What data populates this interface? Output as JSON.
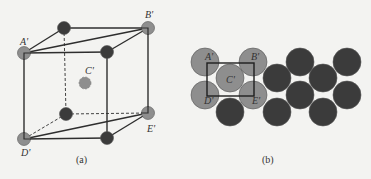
{
  "colors": {
    "background": "#f3f3f1",
    "light_atom": "#8e8e8e",
    "dark_atom": "#3b3b3b",
    "line": "#2e2e2e"
  },
  "panel_a": {
    "caption": "(a)",
    "labels": {
      "A": "A'",
      "B": "B'",
      "C": "C'",
      "D": "D'",
      "E": "E'"
    },
    "atoms": [
      {
        "id": "A",
        "x": 24,
        "y": 53,
        "type": "light"
      },
      {
        "id": "top-back-left",
        "x": 64,
        "y": 28,
        "type": "dark"
      },
      {
        "id": "B",
        "x": 148,
        "y": 28,
        "type": "light"
      },
      {
        "id": "top-front-right",
        "x": 107,
        "y": 52,
        "type": "dark"
      },
      {
        "id": "C",
        "x": 85,
        "y": 83,
        "type": "light-dashed"
      },
      {
        "id": "bottom-back-left",
        "x": 66,
        "y": 114,
        "type": "dark"
      },
      {
        "id": "E",
        "x": 148,
        "y": 113,
        "type": "light"
      },
      {
        "id": "D",
        "x": 24,
        "y": 139,
        "type": "light"
      },
      {
        "id": "bottom-front-right",
        "x": 107,
        "y": 138,
        "type": "dark"
      }
    ]
  },
  "panel_b": {
    "caption": "(b)",
    "labels": {
      "A": "A'",
      "B": "B'",
      "C": "C'",
      "D": "D'",
      "E": "E'"
    }
  }
}
